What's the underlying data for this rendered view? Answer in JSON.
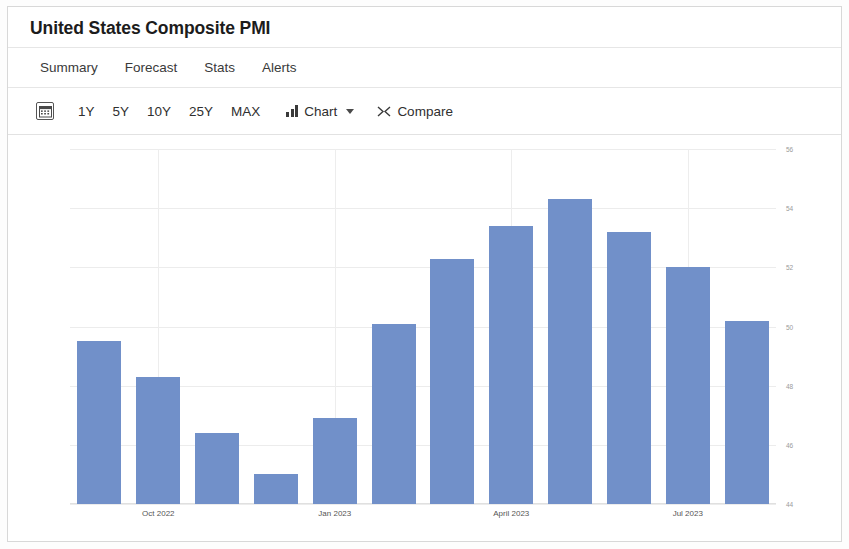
{
  "header": {
    "title": "United States Composite PMI"
  },
  "tabs": [
    {
      "label": "Summary"
    },
    {
      "label": "Forecast"
    },
    {
      "label": "Stats"
    },
    {
      "label": "Alerts"
    }
  ],
  "toolbar": {
    "calendar_icon": "calendar-icon",
    "ranges": [
      {
        "label": "1Y"
      },
      {
        "label": "5Y"
      },
      {
        "label": "10Y"
      },
      {
        "label": "25Y"
      },
      {
        "label": "MAX"
      }
    ],
    "chart_label": "Chart",
    "chart_icon": "bar-chart-icon",
    "chart_caret": "chevron-down-icon",
    "compare_label": "Compare",
    "compare_icon": "shuffle-icon"
  },
  "colors": {
    "bar": "#7190c9",
    "grid": "#ececec",
    "text": "#2f2f2f",
    "axis_text": "#9a9a9a"
  },
  "chart_data": {
    "type": "bar",
    "title": "United States Composite PMI",
    "xlabel": "",
    "ylabel": "",
    "ylim": [
      44,
      56
    ],
    "grid": true,
    "legend": "none",
    "ytick_labels": [
      "56",
      "54",
      "52",
      "50",
      "48",
      "46",
      "44"
    ],
    "ytick_values": [
      56,
      54,
      52,
      50,
      48,
      46,
      44
    ],
    "categories": [
      "Sep 2022",
      "Oct 2022",
      "Nov 2022",
      "Dec 2022",
      "Jan 2023",
      "Feb 2023",
      "Mar 2023",
      "April 2023",
      "May 2023",
      "Jun 2023",
      "Jul 2023",
      "Aug 2023"
    ],
    "xtick_labels": [
      "Oct 2022",
      "Jan 2023",
      "April 2023",
      "Jul 2023"
    ],
    "xtick_indices": [
      1,
      4,
      7,
      10
    ],
    "values": [
      49.5,
      48.3,
      46.4,
      45.0,
      46.9,
      50.1,
      52.3,
      53.4,
      54.3,
      53.2,
      52.0,
      50.2
    ]
  }
}
